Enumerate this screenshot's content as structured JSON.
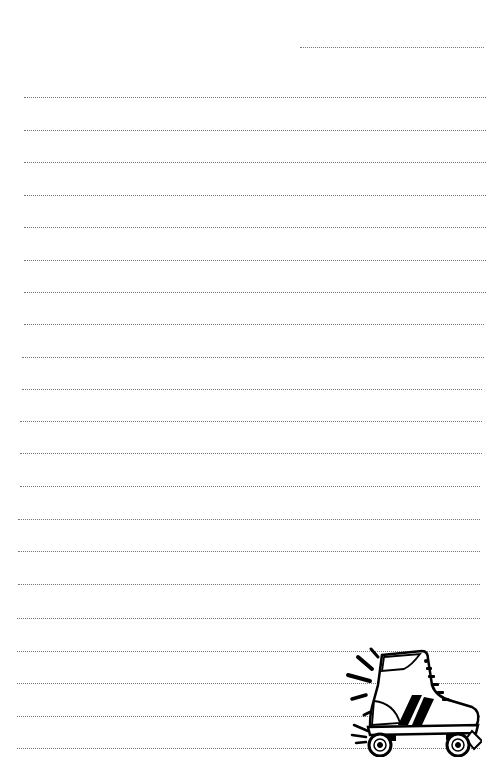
{
  "page": {
    "type": "lined-notepaper",
    "background": "#ffffff",
    "line_color": "#777777",
    "line_style": "dotted",
    "header_line": {
      "x1": 300,
      "x2": 484,
      "y": 47
    },
    "lines": [
      {
        "y": 97,
        "x1": 24,
        "x2": 486
      },
      {
        "y": 130,
        "x1": 24,
        "x2": 486
      },
      {
        "y": 162,
        "x1": 24,
        "x2": 486
      },
      {
        "y": 195,
        "x1": 24,
        "x2": 486
      },
      {
        "y": 227,
        "x1": 24,
        "x2": 486
      },
      {
        "y": 260,
        "x1": 24,
        "x2": 486
      },
      {
        "y": 292,
        "x1": 24,
        "x2": 486
      },
      {
        "y": 324,
        "x1": 24,
        "x2": 484
      },
      {
        "y": 357,
        "x1": 22,
        "x2": 484
      },
      {
        "y": 389,
        "x1": 22,
        "x2": 482
      },
      {
        "y": 421,
        "x1": 20,
        "x2": 482
      },
      {
        "y": 453,
        "x1": 20,
        "x2": 482
      },
      {
        "y": 486,
        "x1": 20,
        "x2": 480
      },
      {
        "y": 519,
        "x1": 18,
        "x2": 480
      },
      {
        "y": 551,
        "x1": 18,
        "x2": 480
      },
      {
        "y": 584,
        "x1": 18,
        "x2": 480
      },
      {
        "y": 618,
        "x1": 17,
        "x2": 480
      },
      {
        "y": 651,
        "x1": 17,
        "x2": 480
      },
      {
        "y": 683,
        "x1": 17,
        "x2": 480
      },
      {
        "y": 716,
        "x1": 17,
        "x2": 480
      },
      {
        "y": 748,
        "x1": 17,
        "x2": 480
      }
    ],
    "illustration": {
      "icon": "roller-skate-icon",
      "position": "bottom-right"
    }
  }
}
